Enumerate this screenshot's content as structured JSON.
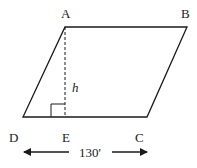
{
  "diagram": {
    "shape": "parallelogram",
    "vertices": {
      "A": {
        "label": "A",
        "x": 65,
        "y": 27
      },
      "B": {
        "label": "B",
        "x": 187,
        "y": 27
      },
      "C": {
        "label": "C",
        "x": 147,
        "y": 117
      },
      "D": {
        "label": "D",
        "x": 23,
        "y": 117
      }
    },
    "foot": {
      "label": "E",
      "x": 65,
      "y": 117
    },
    "height_label": "h",
    "base_dimension": "130'",
    "colors": {
      "stroke": "#1a1a1a",
      "background": "#ffffff"
    }
  }
}
